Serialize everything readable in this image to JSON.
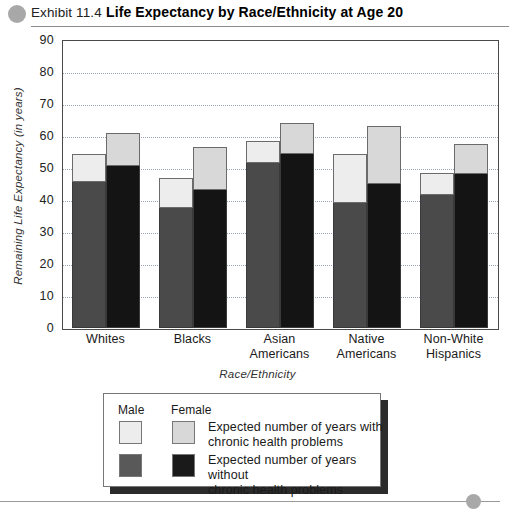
{
  "header": {
    "exhibit_label": "Exhibit 11.4",
    "title": "Life Expectancy by Race/Ethnicity at Age 20",
    "bullet_icon": "circle-bullet-icon"
  },
  "chart_data": {
    "type": "bar",
    "subtype": "grouped-stacked",
    "title": "Life Expectancy by Race/Ethnicity at Age 20",
    "xlabel": "Race/Ethnicity",
    "ylabel": "Remaining Life Expectancy (in years)",
    "ylim": [
      0,
      90
    ],
    "ytick_values": [
      0,
      10,
      20,
      30,
      40,
      50,
      60,
      70,
      80,
      90
    ],
    "ytick_labels": [
      "0",
      "10",
      "20",
      "30",
      "40",
      "50",
      "60",
      "70",
      "80",
      "90"
    ],
    "grid": true,
    "grid_axis": "y",
    "legend_position": "below-plot",
    "categories": [
      "Whites",
      "Blacks",
      "Asian Americans",
      "Native Americans",
      "Non-White Hispanics"
    ],
    "category_lines": [
      [
        "Whites"
      ],
      [
        "Blacks"
      ],
      [
        "Asian",
        "Americans"
      ],
      [
        "Native",
        "Americans"
      ],
      [
        "Non-White",
        "Hispanics"
      ]
    ],
    "series": [
      {
        "name": "Male — years without chronic health problems",
        "sex": "Male",
        "segment": "without",
        "color": "#4a4a4a",
        "values": [
          45.5,
          37.5,
          51.5,
          39.0,
          41.5
        ]
      },
      {
        "name": "Male — years with chronic health problems",
        "sex": "Male",
        "segment": "with",
        "color": "#ededed",
        "values": [
          9.0,
          9.5,
          7.0,
          15.5,
          7.0
        ],
        "totals": [
          54.5,
          47.0,
          58.5,
          54.5,
          48.5
        ]
      },
      {
        "name": "Female — years without chronic health problems",
        "sex": "Female",
        "segment": "without",
        "color": "#141414",
        "values": [
          50.5,
          43.0,
          54.5,
          45.0,
          48.0
        ]
      },
      {
        "name": "Female — years with chronic health problems",
        "sex": "Female",
        "segment": "with",
        "color": "#d8d8d8",
        "values": [
          10.5,
          13.5,
          9.5,
          18.0,
          9.5
        ],
        "totals": [
          61.0,
          56.5,
          64.0,
          63.0,
          57.5
        ]
      }
    ]
  },
  "legend": {
    "col_male": "Male",
    "col_female": "Female",
    "rows": [
      {
        "line1": "Expected number of years with",
        "line2": "chronic health problems",
        "male_color": "#ededed",
        "female_color": "#d8d8d8"
      },
      {
        "line1": "Expected number of years without",
        "line2": "chronic health problems",
        "male_color": "#595959",
        "female_color": "#1a1a1a"
      }
    ]
  },
  "footer": {
    "bullet_icon": "circle-bullet-icon"
  }
}
